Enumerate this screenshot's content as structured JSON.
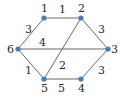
{
  "diagram": {
    "type": "weighted-graph",
    "colors": {
      "node": "#3d7fc1",
      "edge": "#6b6b6b",
      "text": "#2a2a2a"
    },
    "nodes": [
      {
        "id": "1",
        "label": "1",
        "x": 44,
        "y": 18,
        "lx": 41,
        "ly": 12
      },
      {
        "id": "2",
        "label": "2",
        "x": 81,
        "y": 18,
        "lx": 78,
        "ly": 12
      },
      {
        "id": "3",
        "label": "3",
        "x": 108,
        "y": 49,
        "lx": 111,
        "ly": 53
      },
      {
        "id": "4",
        "label": "4",
        "x": 81,
        "y": 79,
        "lx": 78,
        "ly": 92
      },
      {
        "id": "5",
        "label": "5",
        "x": 44,
        "y": 79,
        "lx": 41,
        "ly": 92
      },
      {
        "id": "6",
        "label": "6",
        "x": 18,
        "y": 49,
        "lx": 7,
        "ly": 53
      }
    ],
    "edges": [
      {
        "from": "1",
        "to": "2",
        "weight": "1",
        "wx": 59,
        "wy": 13
      },
      {
        "from": "1",
        "to": "6",
        "weight": "3",
        "wx": 25,
        "wy": 33
      },
      {
        "from": "2",
        "to": "3",
        "weight": "3",
        "wx": 98,
        "wy": 33
      },
      {
        "from": "2",
        "to": "5",
        "weight": "2",
        "wx": 59,
        "wy": 69
      },
      {
        "from": "6",
        "to": "3",
        "weight": "4",
        "wx": 39,
        "wy": 46
      },
      {
        "from": "6",
        "to": "5",
        "weight": "1",
        "wx": 25,
        "wy": 74
      },
      {
        "from": "5",
        "to": "4",
        "weight": "5",
        "wx": 58,
        "wy": 92
      },
      {
        "from": "3",
        "to": "4",
        "weight": "3",
        "wx": 98,
        "wy": 74
      }
    ]
  }
}
